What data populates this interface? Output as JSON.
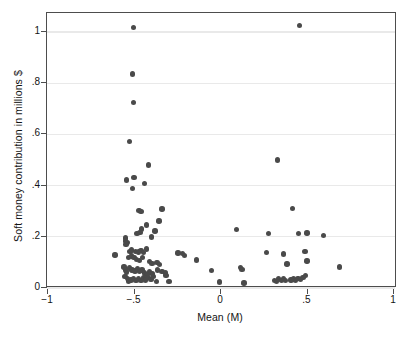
{
  "chart_data": {
    "type": "scatter",
    "title": "",
    "xlabel": "Mean (M)",
    "ylabel": "Soft money contribution in millions $",
    "xlim": [
      -1,
      1
    ],
    "ylim": [
      0,
      1.06
    ],
    "xticks": [
      -1,
      -0.5,
      0,
      0.5,
      1
    ],
    "xtick_labels": [
      "-1",
      "-.5",
      "0",
      ".5",
      "1"
    ],
    "yticks": [
      0,
      0.2,
      0.4,
      0.6,
      0.8,
      1
    ],
    "ytick_labels": [
      "0",
      ".2",
      ".4",
      ".6",
      ".8",
      "1"
    ],
    "grid": "horizontal",
    "legend": null,
    "marker": {
      "color": "#4a4a4a",
      "shape": "circle",
      "size": 5.4
    },
    "points": [
      [
        -0.505,
        1.017
      ],
      [
        0.452,
        1.025
      ],
      [
        -0.512,
        0.836
      ],
      [
        -0.505,
        0.724
      ],
      [
        -0.53,
        0.573
      ],
      [
        -0.418,
        0.481
      ],
      [
        0.327,
        0.5
      ],
      [
        -0.545,
        0.422
      ],
      [
        -0.503,
        0.431
      ],
      [
        -0.443,
        0.409
      ],
      [
        -0.512,
        0.389
      ],
      [
        -0.34,
        0.308
      ],
      [
        -0.475,
        0.303
      ],
      [
        -0.462,
        0.299
      ],
      [
        0.414,
        0.31
      ],
      [
        -0.358,
        0.262
      ],
      [
        -0.43,
        0.246
      ],
      [
        -0.458,
        0.231
      ],
      [
        -0.381,
        0.222
      ],
      [
        -0.468,
        0.218
      ],
      [
        -0.486,
        0.212
      ],
      [
        -0.402,
        0.2
      ],
      [
        -0.553,
        0.196
      ],
      [
        -0.551,
        0.184
      ],
      [
        -0.543,
        0.178
      ],
      [
        -0.549,
        0.171
      ],
      [
        0.09,
        0.228
      ],
      [
        0.273,
        0.213
      ],
      [
        0.449,
        0.214
      ],
      [
        0.498,
        0.215
      ],
      [
        0.592,
        0.205
      ],
      [
        -0.613,
        0.129
      ],
      [
        -0.527,
        0.142
      ],
      [
        -0.516,
        0.148
      ],
      [
        -0.495,
        0.143
      ],
      [
        -0.478,
        0.141
      ],
      [
        -0.462,
        0.146
      ],
      [
        -0.448,
        0.138
      ],
      [
        -0.43,
        0.152
      ],
      [
        -0.534,
        0.12
      ],
      [
        -0.519,
        0.125
      ],
      [
        -0.502,
        0.118
      ],
      [
        -0.487,
        0.112
      ],
      [
        -0.47,
        0.108
      ],
      [
        -0.454,
        0.12
      ],
      [
        -0.414,
        0.104
      ],
      [
        -0.398,
        0.096
      ],
      [
        -0.37,
        0.1
      ],
      [
        -0.354,
        0.092
      ],
      [
        -0.248,
        0.137
      ],
      [
        -0.224,
        0.134
      ],
      [
        -0.21,
        0.126
      ],
      [
        -0.14,
        0.11
      ],
      [
        0.262,
        0.138
      ],
      [
        0.36,
        0.133
      ],
      [
        0.486,
        0.142
      ],
      [
        0.497,
        0.106
      ],
      [
        0.381,
        0.094
      ],
      [
        0.686,
        0.082
      ],
      [
        -0.56,
        0.082
      ],
      [
        -0.553,
        0.07
      ],
      [
        -0.547,
        0.063
      ],
      [
        -0.528,
        0.078
      ],
      [
        -0.514,
        0.071
      ],
      [
        -0.498,
        0.067
      ],
      [
        -0.484,
        0.074
      ],
      [
        -0.47,
        0.064
      ],
      [
        -0.456,
        0.07
      ],
      [
        -0.442,
        0.058
      ],
      [
        -0.428,
        0.052
      ],
      [
        -0.412,
        0.062
      ],
      [
        -0.396,
        0.055
      ],
      [
        -0.368,
        0.071
      ],
      [
        -0.34,
        0.065
      ],
      [
        -0.322,
        0.058
      ],
      [
        -0.318,
        0.048
      ],
      [
        -0.556,
        0.044
      ],
      [
        -0.541,
        0.036
      ],
      [
        -0.533,
        0.028
      ],
      [
        -0.521,
        0.031
      ],
      [
        -0.507,
        0.038
      ],
      [
        -0.491,
        0.03
      ],
      [
        -0.477,
        0.036
      ],
      [
        -0.463,
        0.029
      ],
      [
        -0.449,
        0.04
      ],
      [
        -0.435,
        0.032
      ],
      [
        -0.421,
        0.042
      ],
      [
        -0.405,
        0.034
      ],
      [
        -0.389,
        0.044
      ],
      [
        -0.373,
        0.026
      ],
      [
        -0.3,
        0.025
      ],
      [
        -0.055,
        0.068
      ],
      [
        -0.01,
        0.024
      ],
      [
        0.112,
        0.079
      ],
      [
        0.122,
        0.072
      ],
      [
        0.133,
        0.019
      ],
      [
        0.308,
        0.03
      ],
      [
        0.32,
        0.026
      ],
      [
        0.333,
        0.035
      ],
      [
        0.348,
        0.03
      ],
      [
        0.36,
        0.038
      ],
      [
        0.373,
        0.029
      ],
      [
        0.404,
        0.031
      ],
      [
        0.418,
        0.035
      ],
      [
        0.432,
        0.029
      ],
      [
        0.446,
        0.038
      ],
      [
        0.46,
        0.033
      ],
      [
        0.474,
        0.042
      ],
      [
        0.487,
        0.048
      ]
    ]
  }
}
